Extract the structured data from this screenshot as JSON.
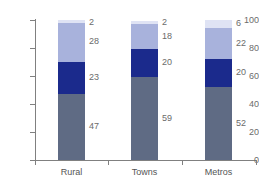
{
  "chart_data": {
    "type": "bar",
    "subtype": "stacked-column",
    "title": "",
    "xlabel": "",
    "ylabel": "",
    "ylim": [
      0,
      100
    ],
    "yticks": [
      0,
      20,
      40,
      60,
      80,
      100
    ],
    "grid": false,
    "legend": "none",
    "categories": [
      "Rural",
      "Towns",
      "Metros"
    ],
    "series": [
      {
        "name": "segment-1",
        "color": "#5f6b84",
        "values": [
          47,
          59,
          52
        ]
      },
      {
        "name": "segment-2",
        "color": "#1b2a8c",
        "values": [
          23,
          20,
          20
        ]
      },
      {
        "name": "segment-3",
        "color": "#a8b2dc",
        "values": [
          28,
          18,
          22
        ]
      },
      {
        "name": "segment-4",
        "color": "#dfe3f4",
        "values": [
          2,
          2,
          6
        ]
      }
    ],
    "data_labels": {
      "Rural": [
        "47",
        "23",
        "28",
        "2"
      ],
      "Towns": [
        "59",
        "20",
        "18",
        "2"
      ],
      "Metros": [
        "52",
        "20",
        "22",
        "6"
      ]
    }
  },
  "axis": {
    "y_tick_labels": [
      "100",
      "80",
      "60",
      "40",
      "20",
      "0"
    ],
    "x_tick_labels": [
      "Rural",
      "Towns",
      "Metros"
    ]
  },
  "colors": {
    "axis": "#808080",
    "label_text": "#6b6b6b",
    "category_text": "#555555",
    "background": "#ffffff"
  }
}
